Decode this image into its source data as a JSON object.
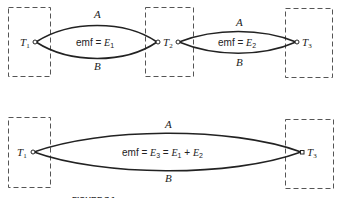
{
  "diagram": {
    "top": {
      "terminals": [
        {
          "label": "T",
          "sub": "1"
        },
        {
          "label": "T",
          "sub": "2"
        },
        {
          "label": "T",
          "sub": "3"
        }
      ],
      "loops": [
        {
          "wire_top": "A",
          "wire_bottom": "B",
          "emf_prefix": "emf = ",
          "emf_var": "E",
          "emf_sub": "1"
        },
        {
          "wire_top": "A",
          "wire_bottom": "B",
          "emf_prefix": "emf = ",
          "emf_var": "E",
          "emf_sub": "2"
        }
      ]
    },
    "bottom": {
      "terminals": [
        {
          "label": "T",
          "sub": "1"
        },
        {
          "label": "T",
          "sub": "3"
        }
      ],
      "loop": {
        "wire_top": "A",
        "wire_bottom": "B",
        "emf_prefix": "emf = ",
        "emf_var": "E",
        "emf_sub": "3",
        "eq": " = ",
        "term1_var": "E",
        "term1_sub": "1",
        "plus": " + ",
        "term2_var": "E",
        "term2_sub": "2"
      }
    },
    "caption_partial": "FIGURE 7.1 …"
  }
}
